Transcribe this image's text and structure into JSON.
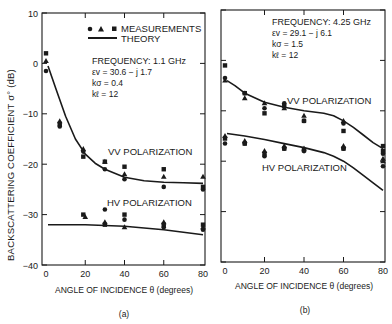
{
  "figure": {
    "ylabel": "BACKSCATTERING COEFFICIENT σ° (dB)",
    "legend": {
      "measurements_label": "MEASUREMENTS",
      "theory_label": "THEORY",
      "marker_icons": [
        "circle-marker",
        "triangle-marker",
        "square-marker"
      ]
    },
    "colors": {
      "ink": "#1a1a1a",
      "background": "#ffffff"
    }
  },
  "chart_data": [
    {
      "panel": "(a)",
      "type": "scatter",
      "xlabel": "ANGLE OF INCIDENCE θ (degrees)",
      "ylabel": "BACKSCATTERING COEFFICIENT σ° (dB)",
      "xlim": [
        0,
        80
      ],
      "ylim": [
        -40,
        10
      ],
      "xticks": [
        0,
        20,
        40,
        60,
        80
      ],
      "yticks": [
        10,
        0,
        -10,
        -20,
        -30,
        -40
      ],
      "annotations": {
        "frequency": "FREQUENCY:  1.1 GHz",
        "epsilon": "εv = 30.6 − j 1.7",
        "ksigma": "kσ = 0.4",
        "kl": "kℓ = 12",
        "vv_label": "VV POLARIZATION",
        "hv_label": "HV POLARIZATION"
      },
      "series": [
        {
          "name": "VV theory",
          "kind": "line",
          "x": [
            1,
            5,
            10,
            15,
            20,
            25,
            30,
            40,
            50,
            60,
            70,
            80
          ],
          "y": [
            -0.5,
            -5,
            -10.5,
            -15,
            -18,
            -19.8,
            -21,
            -22.6,
            -23.3,
            -23.6,
            -23.7,
            -23.8
          ]
        },
        {
          "name": "HV theory",
          "kind": "line",
          "x": [
            1,
            20,
            40,
            60,
            80
          ],
          "y": [
            -32,
            -32,
            -32.3,
            -33,
            -34
          ]
        },
        {
          "name": "VV circles",
          "marker": "circle",
          "x": [
            0,
            7,
            19,
            30,
            40,
            60,
            80
          ],
          "y": [
            -1.5,
            -12.5,
            -17.5,
            -21,
            -23,
            -24.5,
            -25
          ]
        },
        {
          "name": "VV triangles",
          "marker": "triangle",
          "x": [
            0,
            7,
            19,
            30,
            40,
            60,
            80
          ],
          "y": [
            0.5,
            -11.5,
            -17,
            -19.5,
            -22,
            -22.5,
            -22.5
          ]
        },
        {
          "name": "VV squares",
          "marker": "square",
          "x": [
            0,
            7,
            19,
            30,
            40,
            60,
            80
          ],
          "y": [
            2,
            -12,
            -18.5,
            -19.5,
            -20.5,
            -21,
            -24.5
          ]
        },
        {
          "name": "HV circles",
          "marker": "circle",
          "x": [
            30,
            40,
            60,
            80
          ],
          "y": [
            -29,
            -31,
            -32.5,
            -33
          ]
        },
        {
          "name": "HV triangles",
          "marker": "triangle",
          "x": [
            20,
            30,
            40,
            60,
            80
          ],
          "y": [
            -30.5,
            -31.5,
            -32.5,
            -31.5,
            -32.5
          ]
        },
        {
          "name": "HV squares",
          "marker": "square",
          "x": [
            19,
            30,
            40,
            60,
            80
          ],
          "y": [
            -30,
            -32,
            -30,
            -32,
            -32
          ]
        }
      ]
    },
    {
      "panel": "(b)",
      "type": "scatter",
      "xlabel": "ANGLE OF INCIDENCE θ (degrees)",
      "ylabel": "BACKSCATTERING COEFFICIENT σ° (dB)",
      "xlim": [
        0,
        80
      ],
      "ylim": [
        -40,
        10
      ],
      "xticks": [
        0,
        20,
        40,
        60,
        80
      ],
      "yticks": [
        10,
        0,
        -10,
        -20,
        -30,
        -40
      ],
      "annotations": {
        "frequency": "FREQUENCY:  4.25 GHz",
        "epsilon": "εv = 29.1 − j 6.1",
        "ksigma": "kσ = 1.5",
        "kl": "kℓ = 12",
        "vv_label": "VV POLARIZATION",
        "hv_label": "HV POLARIZATION"
      },
      "series": [
        {
          "name": "VV theory",
          "kind": "line",
          "x": [
            1,
            5,
            10,
            20,
            30,
            40,
            50,
            55,
            60,
            65,
            70,
            75,
            80
          ],
          "y": [
            -4,
            -5,
            -6.5,
            -8.3,
            -9.3,
            -10,
            -10.5,
            -11,
            -12,
            -13.3,
            -14.8,
            -16.3,
            -17.5
          ]
        },
        {
          "name": "HV theory",
          "kind": "line",
          "x": [
            1,
            10,
            20,
            30,
            40,
            50,
            55,
            60,
            65,
            70,
            75,
            80
          ],
          "y": [
            -14.5,
            -15,
            -15.7,
            -16.5,
            -17.3,
            -18.3,
            -19,
            -20,
            -21.3,
            -22.8,
            -24.3,
            -25.8
          ]
        },
        {
          "name": "VV circles",
          "marker": "circle",
          "x": [
            0,
            10,
            20,
            30,
            40,
            60,
            80
          ],
          "y": [
            -3.5,
            -6.5,
            -9.5,
            -8.5,
            -12,
            -12.5,
            -21
          ]
        },
        {
          "name": "VV triangles",
          "marker": "triangle",
          "x": [
            0,
            10,
            20,
            30,
            40,
            60,
            80
          ],
          "y": [
            -4,
            -7.5,
            -8.5,
            -9.5,
            -11,
            -12,
            -20
          ]
        },
        {
          "name": "VV squares",
          "marker": "square",
          "x": [
            0,
            10,
            20,
            30,
            40,
            60,
            80
          ],
          "y": [
            -1,
            -6.5,
            -10.5,
            -9,
            -12,
            -14,
            -17
          ]
        },
        {
          "name": "HV circles",
          "marker": "circle",
          "x": [
            0,
            10,
            20,
            30,
            40,
            60,
            80
          ],
          "y": [
            -16.5,
            -16.5,
            -19,
            -17.5,
            -18,
            -17.5,
            -18.5
          ]
        },
        {
          "name": "HV triangles",
          "marker": "triangle",
          "x": [
            0,
            10,
            20,
            30,
            40,
            60,
            80
          ],
          "y": [
            -15,
            -16,
            -18,
            -17,
            -17.5,
            -17,
            -19.5
          ]
        },
        {
          "name": "HV squares",
          "marker": "square",
          "x": [
            0,
            10,
            20,
            30,
            40,
            60,
            80
          ],
          "y": [
            -15.5,
            -16.5,
            -18.5,
            -17.5,
            -17.8,
            -17.5,
            -18
          ]
        }
      ]
    }
  ]
}
